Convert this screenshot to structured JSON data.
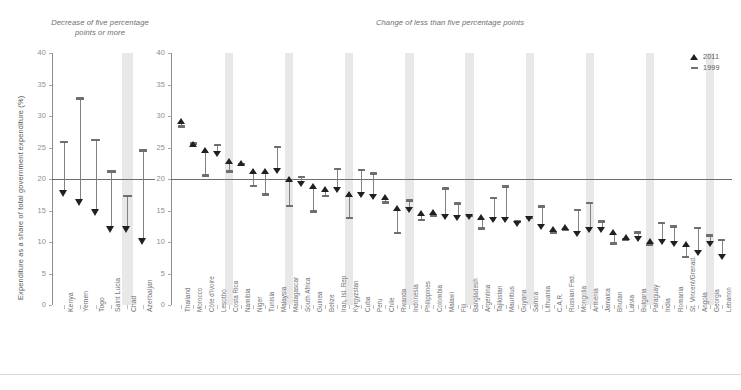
{
  "chart_data": {
    "type": "scatter",
    "title": "",
    "ylabel": "Expenditure as a share of total government expenditure (%)",
    "xlabel": "",
    "ylim": [
      0,
      40
    ],
    "yticks": [
      0,
      5,
      10,
      15,
      20,
      25,
      30,
      35,
      40
    ],
    "reference_line": 20,
    "grid": false,
    "legend_position": "top-right",
    "series": [
      {
        "name": "2011",
        "marker": "triangle"
      },
      {
        "name": "1999",
        "marker": "dash"
      }
    ],
    "panels": [
      {
        "title": "Decrease of five percentage points or more",
        "categories": [
          "Kenya",
          "Yemen",
          "Togo",
          "Saint Lucia",
          "Chad",
          "Azerbaijan"
        ],
        "values_1999": [
          25.9,
          32.8,
          26.2,
          21.2,
          17.3,
          24.5
        ],
        "values_2011": [
          17.6,
          16.3,
          14.7,
          11.9,
          11.9,
          10.1
        ],
        "shaded_indices": [
          4
        ]
      },
      {
        "title": "Change of less than five percentage points",
        "categories": [
          "Thailand",
          "Morocco",
          "Côte d'Ivoire",
          "Lesotho",
          "Costa Rica",
          "Namibia",
          "Niger",
          "Tunisia",
          "Malaysia",
          "Madagascar",
          "South Africa",
          "Guinea",
          "Belize",
          "Iran, Isl. Rep",
          "Kyrgyzstan",
          "Cuba",
          "Peru",
          "Chile",
          "Rwanda",
          "Indonesia",
          "Philippines",
          "Colombia",
          "Malawi",
          "Fiji",
          "Bangladesh",
          "Argentina",
          "Tajikistan",
          "Mauritius",
          "Guyana",
          "Samoa",
          "Lithuania",
          "C.A.R.",
          "Russian Fed.",
          "Mongolia",
          "Armenia",
          "Jamaica",
          "Bhutan",
          "Latvia",
          "Bulgaria",
          "Paraguay",
          "India",
          "Romania",
          "St. Vincent/Grenad.",
          "Angola",
          "Georgia",
          "Lebanon"
        ],
        "values_1999": [
          28.3,
          25.6,
          20.6,
          25.4,
          21.2,
          22.4,
          18.9,
          17.5,
          25.1,
          15.7,
          20.3,
          14.8,
          17.3,
          21.6,
          13.8,
          21.4,
          20.9,
          16.3,
          11.4,
          16.6,
          13.5,
          14.2,
          18.5,
          16.1,
          14.1,
          12.1,
          17.0,
          18.8,
          13.3,
          13.9,
          15.6,
          11.5,
          11.9,
          15.1,
          16.2,
          13.3,
          9.8,
          10.4,
          11.5,
          9.5,
          13.0,
          12.5,
          7.6,
          12.2,
          11.0,
          10.3
        ],
        "values_2011": [
          29.2,
          25.6,
          24.5,
          23.9,
          22.9,
          22.5,
          21.2,
          21.2,
          21.3,
          20.0,
          19.2,
          18.9,
          18.4,
          18.3,
          17.6,
          17.5,
          17.1,
          17.1,
          15.3,
          15.1,
          14.5,
          14.7,
          14.0,
          13.8,
          14.0,
          14.0,
          13.4,
          13.5,
          12.9,
          13.6,
          12.4,
          12.0,
          12.3,
          11.3,
          11.8,
          11.9,
          11.5,
          10.7,
          10.4,
          10.2,
          10.0,
          9.6,
          9.7,
          8.3,
          9.7,
          7.6
        ],
        "shaded_indices": [
          4,
          9,
          14,
          19,
          24,
          29,
          34,
          39,
          44
        ]
      }
    ]
  },
  "legend": {
    "items": [
      {
        "label": "2011",
        "marker": "triangle-up"
      },
      {
        "label": "1999",
        "marker": "dash"
      }
    ]
  }
}
